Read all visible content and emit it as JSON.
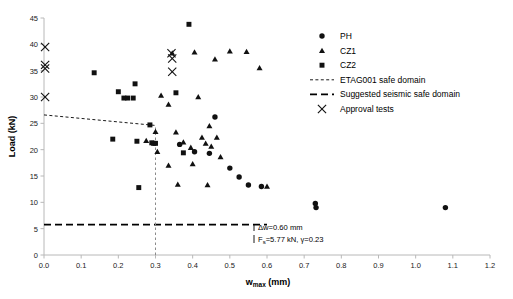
{
  "chart_data": {
    "type": "scatter",
    "title": "",
    "xlabel": "w_max (mm)",
    "ylabel": "Load (kN)",
    "xlim": [
      0.0,
      1.2
    ],
    "ylim": [
      0,
      45
    ],
    "xticks": [
      "0.0",
      "0.1",
      "0.2",
      "0.3",
      "0.4",
      "0.5",
      "0.6",
      "0.7",
      "0.8",
      "0.9",
      "1.0",
      "1.1",
      "1.2"
    ],
    "yticks": [
      "0",
      "5",
      "10",
      "15",
      "20",
      "25",
      "30",
      "35",
      "40",
      "45"
    ],
    "grid": false,
    "legend_position": "top-right",
    "series": [
      {
        "name": "PH",
        "marker": "circle",
        "points": [
          [
            0.365,
            21.0
          ],
          [
            0.405,
            19.6
          ],
          [
            0.445,
            19.3
          ],
          [
            0.46,
            26.2
          ],
          [
            0.5,
            16.5
          ],
          [
            0.525,
            14.8
          ],
          [
            0.55,
            13.3
          ],
          [
            0.585,
            13.0
          ],
          [
            0.73,
            9.8
          ],
          [
            0.732,
            9.0
          ],
          [
            1.08,
            9.0
          ]
        ]
      },
      {
        "name": "CZ1",
        "marker": "triangle",
        "points": [
          [
            0.275,
            21.7
          ],
          [
            0.3,
            23.4
          ],
          [
            0.305,
            19.6
          ],
          [
            0.315,
            30.3
          ],
          [
            0.335,
            28.6
          ],
          [
            0.345,
            38.3
          ],
          [
            0.355,
            23.3
          ],
          [
            0.36,
            13.4
          ],
          [
            0.375,
            21.4
          ],
          [
            0.395,
            20.4
          ],
          [
            0.4,
            17.3
          ],
          [
            0.405,
            38.5
          ],
          [
            0.415,
            30.0
          ],
          [
            0.425,
            22.3
          ],
          [
            0.435,
            21.2
          ],
          [
            0.44,
            13.3
          ],
          [
            0.445,
            24.5
          ],
          [
            0.45,
            20.6
          ],
          [
            0.46,
            37.2
          ],
          [
            0.465,
            22.3
          ],
          [
            0.475,
            18.6
          ],
          [
            0.5,
            38.7
          ],
          [
            0.545,
            38.6
          ],
          [
            0.58,
            35.5
          ],
          [
            0.6,
            13.0
          ],
          [
            0.335,
            17.0
          ]
        ]
      },
      {
        "name": "CZ2",
        "marker": "square",
        "points": [
          [
            0.135,
            34.6
          ],
          [
            0.185,
            22.0
          ],
          [
            0.2,
            31.0
          ],
          [
            0.215,
            29.8
          ],
          [
            0.225,
            29.8
          ],
          [
            0.24,
            29.8
          ],
          [
            0.245,
            32.5
          ],
          [
            0.25,
            21.6
          ],
          [
            0.255,
            12.8
          ],
          [
            0.285,
            24.7
          ],
          [
            0.29,
            21.3
          ],
          [
            0.295,
            21.2
          ],
          [
            0.3,
            21.2
          ],
          [
            0.355,
            30.8
          ],
          [
            0.39,
            43.8
          ],
          [
            0.375,
            19.4
          ]
        ]
      },
      {
        "name": "Approval tests",
        "marker": "x",
        "points": [
          [
            0.003,
            39.5
          ],
          [
            0.003,
            36.1
          ],
          [
            0.003,
            35.4
          ],
          [
            0.003,
            30.0
          ],
          [
            0.343,
            38.3
          ],
          [
            0.345,
            37.3
          ],
          [
            0.345,
            34.8
          ]
        ]
      }
    ],
    "lines": [
      {
        "name": "ETAG001 safe domain",
        "style": "fine-dashed",
        "points": [
          [
            0.0,
            26.6
          ],
          [
            0.3,
            24.6
          ]
        ]
      },
      {
        "name": "Suggested seismic safe domain",
        "style": "coarse-dashed",
        "points": [
          [
            0.0,
            5.77
          ],
          [
            0.6,
            5.77
          ]
        ]
      },
      {
        "name": "delta-w marker",
        "style": "fine-dashed-vertical",
        "points": [
          [
            0.3,
            0.0
          ],
          [
            0.3,
            24.6
          ]
        ]
      }
    ],
    "annotations": [
      {
        "name": "delta-w",
        "text": "Δw=0.60 mm"
      },
      {
        "name": "fs-gamma",
        "text_prefix": "F",
        "text_sub": "s",
        "text_rest": "=5.77 kN,  γ=0.23"
      }
    ]
  },
  "legend": {
    "items": [
      {
        "label": "PH",
        "marker": "circle"
      },
      {
        "label": "CZ1",
        "marker": "triangle"
      },
      {
        "label": "CZ2",
        "marker": "square"
      },
      {
        "label": "ETAG001 safe domain",
        "marker": "fine-dashed-line"
      },
      {
        "label": "Suggested seismic safe domain",
        "marker": "coarse-dashed-line"
      },
      {
        "label": "Approval tests",
        "marker": "x"
      }
    ]
  },
  "axes": {
    "x_title_main": "w",
    "x_title_sub": "max",
    "x_title_unit": " (mm)",
    "y_title": "Load (kN)"
  }
}
